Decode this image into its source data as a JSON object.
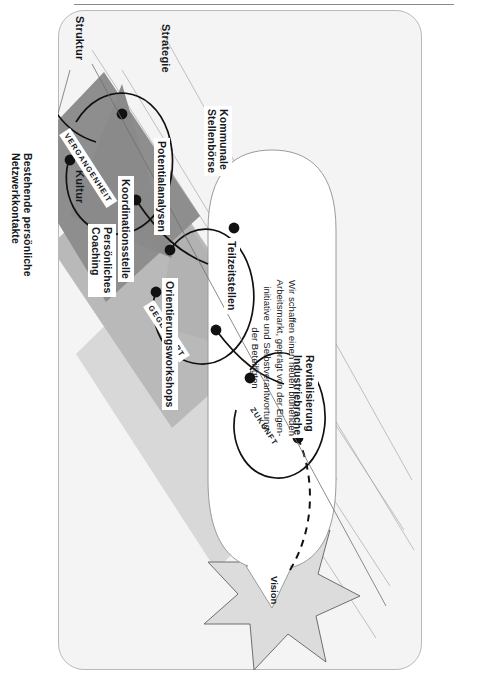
{
  "header": {
    "running_title": "Marion Keil",
    "rule_color": "#8a8a8a"
  },
  "figure": {
    "background": "#f4f4f4",
    "border_color": "#b9b9b9",
    "vision_label": "Vision",
    "vision_bubble": "Wir schaffen einen neuen blühenden\nArbeitsmarkt, geprägt von der Eigen-\ninitiative und Selbstverantwortung\nder Beteiligten",
    "axes": [
      {
        "id": "strategie",
        "label": "Strategie"
      },
      {
        "id": "kultur",
        "label": "Kultur"
      },
      {
        "id": "struktur",
        "label": "Struktur"
      }
    ],
    "time_layers": [
      {
        "id": "vergangenheit",
        "label": "VERGANGENHEIT",
        "fill": "#8e8e8e"
      },
      {
        "id": "gegenwart",
        "label": "GEGENWART",
        "fill": "#b4b4b4"
      },
      {
        "id": "zukunft",
        "label": "ZUKUNFT",
        "fill": "#d4d4d4"
      }
    ],
    "nodes": [
      {
        "id": "bestehende-netzwerkkontakte",
        "label": "Bestehende persönliche\nNetzwerkkontakte"
      },
      {
        "id": "persoenliches-coaching",
        "label": "Persönliches\nCoaching"
      },
      {
        "id": "orientierungsworkshops",
        "label": "Orientierungsworkshops"
      },
      {
        "id": "koordinationsstelle",
        "label": "Koordinationsstelle"
      },
      {
        "id": "potentialanalysen",
        "label": "Potentialanalysen"
      },
      {
        "id": "kommunale-stellenboerse",
        "label": "Kommunale\nStellenbörse"
      },
      {
        "id": "teilzeitstellen",
        "label": "Teilzeitstellen"
      },
      {
        "id": "revitalisierung-industriebrache",
        "label": "Revitalisierung\nIndustriebrache"
      }
    ],
    "colors": {
      "node_dot": "#111111",
      "path_line": "#111111",
      "guide_line": "#9a9a9a",
      "star_fill": "#dcdcdc",
      "star_stroke": "#6e6e6e"
    }
  }
}
